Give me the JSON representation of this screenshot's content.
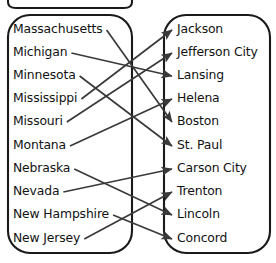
{
  "diagram": {
    "type": "bipartite-arrow-mapping",
    "colors": {
      "background": "#ffffff",
      "oval_stroke": "#1a1a1a",
      "arrow_stroke": "#3a3a3a",
      "text": "#121212"
    },
    "left_set": {
      "name": "states-oval",
      "items": [
        {
          "label": "Massachusetts",
          "y": 29
        },
        {
          "label": "Michigan",
          "y": 52
        },
        {
          "label": "Minnesota",
          "y": 75
        },
        {
          "label": "Mississippi",
          "y": 98
        },
        {
          "label": "Missouri",
          "y": 121
        },
        {
          "label": "Montana",
          "y": 145
        },
        {
          "label": "Nebraska",
          "y": 168
        },
        {
          "label": "Nevada",
          "y": 191
        },
        {
          "label": "New Hampshire",
          "y": 214
        },
        {
          "label": "New Jersey",
          "y": 238
        }
      ]
    },
    "right_set": {
      "name": "capitals-oval",
      "items": [
        {
          "label": "Jackson",
          "y": 29
        },
        {
          "label": "Jefferson City",
          "y": 52
        },
        {
          "label": "Lansing",
          "y": 75
        },
        {
          "label": "Helena",
          "y": 98
        },
        {
          "label": "Boston",
          "y": 121
        },
        {
          "label": "St. Paul",
          "y": 145
        },
        {
          "label": "Carson City",
          "y": 168
        },
        {
          "label": "Trenton",
          "y": 191
        },
        {
          "label": "Lincoln",
          "y": 214
        },
        {
          "label": "Concord",
          "y": 238
        }
      ]
    },
    "mappings": [
      {
        "from": "Massachusetts",
        "to": "Boston",
        "from_index": 0,
        "to_index": 4
      },
      {
        "from": "Michigan",
        "to": "Lansing",
        "from_index": 1,
        "to_index": 2
      },
      {
        "from": "Minnesota",
        "to": "St. Paul",
        "from_index": 2,
        "to_index": 5
      },
      {
        "from": "Mississippi",
        "to": "Jackson",
        "from_index": 3,
        "to_index": 0
      },
      {
        "from": "Missouri",
        "to": "Jefferson City",
        "from_index": 4,
        "to_index": 1
      },
      {
        "from": "Montana",
        "to": "Helena",
        "from_index": 5,
        "to_index": 3
      },
      {
        "from": "Nebraska",
        "to": "Lincoln",
        "from_index": 6,
        "to_index": 8
      },
      {
        "from": "Nevada",
        "to": "Carson City",
        "from_index": 7,
        "to_index": 6
      },
      {
        "from": "New Hampshire",
        "to": "Concord",
        "from_index": 8,
        "to_index": 9
      },
      {
        "from": "New Jersey",
        "to": "Trenton",
        "from_index": 9,
        "to_index": 7
      }
    ]
  }
}
